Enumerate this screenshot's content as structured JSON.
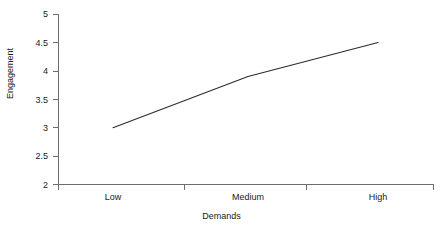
{
  "chart_data": {
    "type": "line",
    "title": "",
    "subtitle": "",
    "xlabel": "Demands",
    "ylabel": "Engagement",
    "categories": [
      "Low",
      "Medium",
      "High"
    ],
    "values": [
      3.0,
      3.9,
      4.5
    ],
    "series": [
      {
        "name": "Engagement",
        "values": [
          3.0,
          3.9,
          4.5
        ]
      }
    ],
    "ylim": [
      2,
      5
    ],
    "yticks": [
      2,
      2.5,
      3,
      3.5,
      4,
      4.5,
      5
    ],
    "ytick_labels": [
      "2",
      "2.5",
      "3",
      "3.5",
      "4",
      "4.5",
      "5"
    ],
    "xtick_labels": [
      "Low",
      "Medium",
      "High"
    ],
    "grid": false,
    "legend": false,
    "legend_position": "none",
    "line_color": "#2b2b2b",
    "axis_color": "#6e6e6e",
    "background_color": "#ffffff",
    "markers": false
  },
  "axes": {
    "y_title": "Engagement",
    "x_title": "Demands"
  }
}
